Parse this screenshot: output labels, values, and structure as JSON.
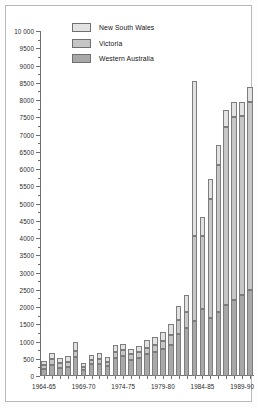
{
  "chart_data": {
    "type": "bar",
    "subtype": "stacked-bar",
    "title": "",
    "xlabel": "",
    "ylabel": "",
    "ylim": [
      0,
      10000
    ],
    "ytick_step": 500,
    "grid": false,
    "legend_position": "top-left-inside",
    "ytick_labels": [
      "0",
      "500",
      "1000",
      "1500",
      "2000",
      "2500",
      "3000",
      "3500",
      "4000",
      "4500",
      "5000",
      "5500",
      "6000",
      "6500",
      "7000",
      "7500",
      "8000",
      "8500",
      "9000",
      "9500",
      "10 000"
    ],
    "ytick_values": [
      0,
      500,
      1000,
      1500,
      2000,
      2500,
      3000,
      3500,
      4000,
      4500,
      5000,
      5500,
      6000,
      6500,
      7000,
      7500,
      8000,
      8500,
      9000,
      9500,
      10000
    ],
    "categories": [
      "1964-65",
      "1965-66",
      "1966-67",
      "1967-68",
      "1968-69",
      "1969-70",
      "1970-71",
      "1971-72",
      "1972-73",
      "1973-74",
      "1974-75",
      "1975-76",
      "1976-77",
      "1977-78",
      "1978-79",
      "1979-80",
      "1980-81",
      "1981-82",
      "1982-83",
      "1983-84",
      "1984-85",
      "1985-86",
      "1986-87",
      "1987-88",
      "1988-89",
      "1989-90",
      "1990-91"
    ],
    "xtick_labels": [
      {
        "category": "1964-65",
        "label": "1964-65"
      },
      {
        "category": "1969-70",
        "label": "1969-70"
      },
      {
        "category": "1974-75",
        "label": "1974-75"
      },
      {
        "category": "1979-80",
        "label": "1979-80"
      },
      {
        "category": "1984-85",
        "label": "1984-85"
      },
      {
        "category": "1989-90",
        "label": "1989-90"
      }
    ],
    "series": [
      {
        "name": "Western Australia",
        "color": "#a8a8a8",
        "values": [
          200,
          330,
          245,
          270,
          540,
          175,
          345,
          355,
          300,
          520,
          580,
          475,
          520,
          640,
          690,
          780,
          900,
          1230,
          1400,
          1600,
          1930,
          1680,
          1850,
          2050,
          2200,
          2350,
          2500
        ]
      },
      {
        "name": "Victoria",
        "color": "#c6c6c6",
        "values": [
          115,
          150,
          130,
          140,
          190,
          95,
          125,
          140,
          120,
          175,
          165,
          150,
          165,
          185,
          215,
          240,
          290,
          385,
          450,
          2470,
          2140,
          3460,
          4280,
          5180,
          5300,
          5180,
          5450
        ]
      },
      {
        "name": "New South Wales",
        "color": "#e2e2e2",
        "values": [
          135,
          185,
          160,
          165,
          250,
          120,
          150,
          165,
          140,
          195,
          185,
          165,
          180,
          205,
          240,
          265,
          320,
          420,
          500,
          4480,
          530,
          580,
          560,
          480,
          430,
          410,
          420
        ]
      }
    ],
    "totals": [
      450,
      665,
      535,
      575,
      980,
      390,
      620,
      660,
      560,
      890,
      930,
      790,
      865,
      1030,
      1145,
      1285,
      1510,
      2035,
      2350,
      8550,
      4600,
      5720,
      6690,
      7710,
      7930,
      7940,
      8370
    ]
  },
  "legend": {
    "items": [
      {
        "label": "New South Wales",
        "key": "nsw"
      },
      {
        "label": "Victoria",
        "key": "vic"
      },
      {
        "label": "Western Australia",
        "key": "wa"
      }
    ]
  }
}
